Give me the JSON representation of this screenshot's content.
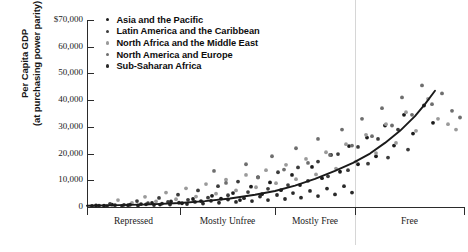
{
  "chart_data": {
    "type": "scatter",
    "title": "",
    "ylabel_line1": "Per Capita GDP",
    "ylabel_line2": "(at purchasing power parity)",
    "xlabel": "",
    "ylim": [
      0,
      70000
    ],
    "yticks": [
      0,
      10000,
      20000,
      30000,
      40000,
      50000,
      60000,
      70000
    ],
    "ytick_labels": [
      "0",
      "10,000",
      "20,000",
      "30,000",
      "40,000",
      "50,000",
      "60,000",
      "70,000"
    ],
    "ytick_top_label": "$70,000",
    "categories": [
      "Repressed",
      "Mostly Unfree",
      "Mostly Free",
      "Free"
    ],
    "category_boundaries": [
      87,
      180,
      275,
      355,
      464
    ],
    "grid": false,
    "legend_position": "top-left-inside",
    "legend": [
      {
        "name": "Asia and the Pacific",
        "color": "#1c1c1c"
      },
      {
        "name": "Latin America and the Caribbean",
        "color": "#3c3c3c"
      },
      {
        "name": "North Africa and the Middle East",
        "color": "#9a9a9a"
      },
      {
        "name": "North America and Europe",
        "color": "#6e6e6e"
      },
      {
        "name": "Sub-Saharan Africa",
        "color": "#2a2a2a"
      }
    ],
    "trendline": {
      "description": "exponential best-fit curve rising from near 0 at left to about 44,000 at right",
      "color": "#1a1a1a",
      "points": [
        [
          87,
          450
        ],
        [
          120,
          700
        ],
        [
          150,
          1000
        ],
        [
          180,
          1500
        ],
        [
          205,
          2200
        ],
        [
          230,
          3200
        ],
        [
          255,
          4600
        ],
        [
          275,
          6000
        ],
        [
          295,
          8000
        ],
        [
          315,
          10500
        ],
        [
          335,
          13500
        ],
        [
          353,
          16500
        ],
        [
          370,
          20000
        ],
        [
          385,
          24000
        ],
        [
          400,
          28500
        ],
        [
          415,
          34000
        ],
        [
          425,
          38500
        ],
        [
          435,
          43500
        ]
      ]
    },
    "series": [
      {
        "name": "Asia and the Pacific",
        "color": "#1c1c1c",
        "points": [
          [
            96,
            600
          ],
          [
            104,
            500
          ],
          [
            112,
            900
          ],
          [
            128,
            700
          ],
          [
            141,
            1100
          ],
          [
            152,
            1500
          ],
          [
            160,
            900
          ],
          [
            171,
            2100
          ],
          [
            182,
            1400
          ],
          [
            193,
            3000
          ],
          [
            201,
            2200
          ],
          [
            212,
            4200
          ],
          [
            221,
            3100
          ],
          [
            233,
            5200
          ],
          [
            240,
            2600
          ],
          [
            251,
            7600
          ],
          [
            262,
            4800
          ],
          [
            270,
            9200
          ],
          [
            281,
            6300
          ],
          [
            292,
            12000
          ],
          [
            300,
            8200
          ],
          [
            312,
            15000
          ],
          [
            322,
            10800
          ],
          [
            331,
            19500
          ],
          [
            340,
            13200
          ],
          [
            349,
            22800
          ],
          [
            358,
            16000
          ],
          [
            367,
            26000
          ],
          [
            376,
            19000
          ],
          [
            385,
            30500
          ],
          [
            394,
            23000
          ],
          [
            404,
            34500
          ],
          [
            413,
            27500
          ],
          [
            424,
            38000
          ],
          [
            433,
            31500
          ]
        ]
      },
      {
        "name": "Latin America and the Caribbean",
        "color": "#3c3c3c",
        "points": [
          [
            110,
            1200
          ],
          [
            124,
            800
          ],
          [
            137,
            2200
          ],
          [
            148,
            1400
          ],
          [
            159,
            3400
          ],
          [
            168,
            1900
          ],
          [
            178,
            4600
          ],
          [
            188,
            2700
          ],
          [
            198,
            6200
          ],
          [
            208,
            3500
          ],
          [
            218,
            7800
          ],
          [
            228,
            4400
          ],
          [
            238,
            9500
          ],
          [
            248,
            5600
          ],
          [
            258,
            11200
          ],
          [
            268,
            6800
          ],
          [
            278,
            13000
          ],
          [
            288,
            8200
          ],
          [
            298,
            14800
          ],
          [
            308,
            9800
          ],
          [
            318,
            17000
          ],
          [
            328,
            11500
          ],
          [
            338,
            19800
          ],
          [
            348,
            13800
          ],
          [
            358,
            22500
          ],
          [
            368,
            16200
          ],
          [
            378,
            25500
          ],
          [
            388,
            18500
          ],
          [
            398,
            29000
          ],
          [
            408,
            21500
          ]
        ]
      },
      {
        "name": "North Africa and the Middle East",
        "color": "#9a9a9a",
        "points": [
          [
            118,
            2600
          ],
          [
            132,
            1500
          ],
          [
            145,
            3800
          ],
          [
            156,
            2100
          ],
          [
            166,
            5400
          ],
          [
            176,
            2900
          ],
          [
            186,
            7000
          ],
          [
            196,
            3900
          ],
          [
            206,
            8600
          ],
          [
            216,
            5000
          ],
          [
            226,
            10200
          ],
          [
            236,
            6200
          ],
          [
            246,
            12000
          ],
          [
            256,
            7400
          ],
          [
            266,
            13800
          ],
          [
            276,
            8900
          ],
          [
            286,
            15800
          ],
          [
            296,
            10400
          ],
          [
            306,
            18000
          ],
          [
            316,
            12200
          ],
          [
            326,
            20500
          ],
          [
            336,
            14400
          ],
          [
            346,
            23500
          ],
          [
            356,
            17000
          ],
          [
            366,
            27000
          ],
          [
            376,
            20200
          ],
          [
            386,
            31000
          ],
          [
            396,
            24000
          ],
          [
            406,
            35500
          ],
          [
            416,
            28500
          ],
          [
            428,
            40500
          ],
          [
            438,
            33000
          ],
          [
            448,
            31000
          ],
          [
            456,
            29000
          ]
        ]
      },
      {
        "name": "North America and Europe",
        "color": "#6e6e6e",
        "points": [
          [
            214,
            13500
          ],
          [
            226,
            9000
          ],
          [
            246,
            16000
          ],
          [
            258,
            11000
          ],
          [
            272,
            19000
          ],
          [
            284,
            14000
          ],
          [
            296,
            22000
          ],
          [
            308,
            16500
          ],
          [
            318,
            25500
          ],
          [
            330,
            19500
          ],
          [
            342,
            29000
          ],
          [
            352,
            23000
          ],
          [
            362,
            33000
          ],
          [
            372,
            26500
          ],
          [
            382,
            37000
          ],
          [
            392,
            30500
          ],
          [
            402,
            41000
          ],
          [
            412,
            34500
          ],
          [
            422,
            45500
          ],
          [
            432,
            38500
          ],
          [
            442,
            42500
          ],
          [
            452,
            36000
          ],
          [
            460,
            33500
          ]
        ]
      },
      {
        "name": "Sub-Saharan Africa",
        "color": "#2a2a2a",
        "points": [
          [
            92,
            400
          ],
          [
            99,
            550
          ],
          [
            107,
            350
          ],
          [
            115,
            700
          ],
          [
            122,
            450
          ],
          [
            130,
            850
          ],
          [
            138,
            600
          ],
          [
            146,
            1000
          ],
          [
            154,
            750
          ],
          [
            162,
            1300
          ],
          [
            170,
            900
          ],
          [
            179,
            1600
          ],
          [
            187,
            1100
          ],
          [
            195,
            1900
          ],
          [
            203,
            1300
          ],
          [
            211,
            2300
          ],
          [
            219,
            1600
          ],
          [
            228,
            2800
          ],
          [
            236,
            1900
          ],
          [
            244,
            3300
          ],
          [
            252,
            2200
          ],
          [
            260,
            3900
          ],
          [
            268,
            2600
          ],
          [
            277,
            4500
          ],
          [
            285,
            3000
          ],
          [
            293,
            5200
          ],
          [
            301,
            3500
          ],
          [
            310,
            6000
          ],
          [
            318,
            4100
          ],
          [
            327,
            6900
          ],
          [
            335,
            4700
          ],
          [
            344,
            7800
          ],
          [
            352,
            5400
          ]
        ]
      }
    ]
  }
}
